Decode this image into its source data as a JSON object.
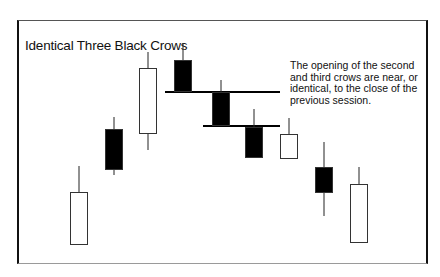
{
  "chart_data": {
    "type": "candlestick",
    "title": "Identical Three Black Crows",
    "annotation": [
      "The opening of the second",
      "and third crows are near, or",
      "identical, to the close of the",
      "previous session."
    ],
    "xlabel": "",
    "ylabel": "",
    "grid": false,
    "legend": null,
    "note": "Values are in screen pixel units (y increases downward); no axes are shown.",
    "candles": [
      {
        "index": 1,
        "color": "white",
        "high": 166,
        "open": 245,
        "close": 192,
        "low": 245
      },
      {
        "index": 2,
        "color": "black",
        "high": 117,
        "open": 129,
        "close": 170,
        "low": 175
      },
      {
        "index": 3,
        "color": "white",
        "high": 52,
        "open": 134,
        "close": 68,
        "low": 150
      },
      {
        "index": 4,
        "color": "black",
        "high": 43,
        "open": 60,
        "close": 92,
        "low": 92,
        "role": "first crow"
      },
      {
        "index": 5,
        "color": "black",
        "high": 80,
        "open": 92,
        "close": 126,
        "low": 126,
        "role": "second crow"
      },
      {
        "index": 6,
        "color": "black",
        "high": 109,
        "open": 127,
        "close": 158,
        "low": 158,
        "role": "third crow"
      },
      {
        "index": 7,
        "color": "white",
        "high": 118,
        "open": 159,
        "close": 134,
        "low": 159
      },
      {
        "index": 8,
        "color": "black",
        "high": 142,
        "open": 167,
        "close": 193,
        "low": 216
      },
      {
        "index": 9,
        "color": "white",
        "high": 167,
        "open": 243,
        "close": 184,
        "low": 243
      }
    ],
    "reference_lines": [
      {
        "y": 92,
        "x_start": 165,
        "x_end": 280,
        "label": "close of first crow / open of second"
      },
      {
        "y": 126,
        "x_start": 203,
        "x_end": 280,
        "label": "close of second crow / open of third"
      }
    ]
  },
  "geometry": {
    "candle_x": [
      70,
      105,
      139,
      174,
      212,
      245,
      280,
      315,
      350
    ],
    "candle_width": 18
  },
  "colors": {
    "bull_fill": "#ffffff",
    "bear_fill": "#000000",
    "outline": "#000000",
    "text": "#111111"
  }
}
